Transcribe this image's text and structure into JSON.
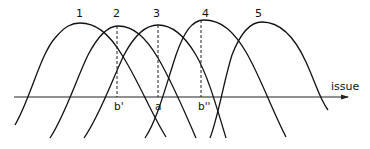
{
  "diagram": {
    "axis_label": "issue",
    "curves": [
      {
        "label": "1",
        "peak_x": 80
      },
      {
        "label": "2",
        "peak_x": 118
      },
      {
        "label": "3",
        "peak_x": 158
      },
      {
        "label": "4",
        "peak_x": 202
      },
      {
        "label": "5",
        "peak_x": 262
      }
    ],
    "points": [
      {
        "label": "b'",
        "x": 117
      },
      {
        "label": "a",
        "x": 158
      },
      {
        "label": "b''",
        "x": 202
      }
    ],
    "colors": {
      "line": "#111111",
      "background": "#ffffff"
    }
  }
}
